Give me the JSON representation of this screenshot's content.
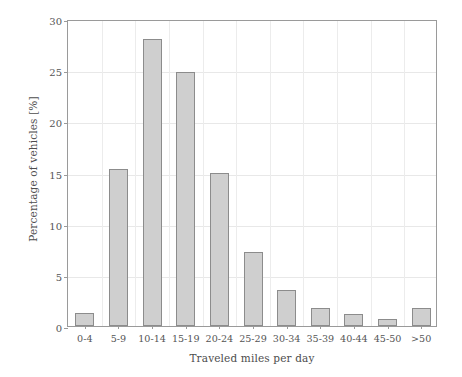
{
  "chart_data": {
    "type": "bar",
    "title": "",
    "xlabel": "Traveled miles per day",
    "ylabel": "Percentage of vehicles [%]",
    "categories": [
      "0-4",
      "5-9",
      "10-14",
      "15-19",
      "20-24",
      "25-29",
      "30-34",
      "35-39",
      "40-44",
      "45-50",
      ">50"
    ],
    "values": [
      1.3,
      15.3,
      28.0,
      24.8,
      15.0,
      7.2,
      3.5,
      1.8,
      1.2,
      0.7,
      1.8
    ],
    "ylim": [
      0,
      30
    ],
    "yticks": [
      0,
      5,
      10,
      15,
      20,
      25,
      30
    ],
    "ytick_labels": [
      "0",
      "5",
      "10",
      "15",
      "20",
      "25",
      "30"
    ],
    "grid": "both",
    "legend": "none",
    "bar_fill": "#cfcfcf",
    "bar_edge": "#8c8c8c",
    "axis_color": "#9a9a9a",
    "grid_color": "#e8e8e8"
  }
}
